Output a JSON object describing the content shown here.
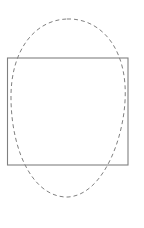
{
  "diagram": {
    "background": "#ffffff",
    "rectangle": {
      "x": 7.5,
      "y": 58,
      "width": 120.5,
      "height": 107,
      "stroke": "#808080",
      "stroke_width": 1.1,
      "style": "solid"
    },
    "dashed_oval": {
      "path": "M 67 19 C 95 18, 122 40, 125 85 C 128 130, 105 195, 68 197 C 35 198, 12 155, 11 100 C 10 50, 35 20, 67 19 Z",
      "stroke": "#808080",
      "stroke_width": 1,
      "dasharray": "4 3",
      "style": "dashed"
    }
  }
}
